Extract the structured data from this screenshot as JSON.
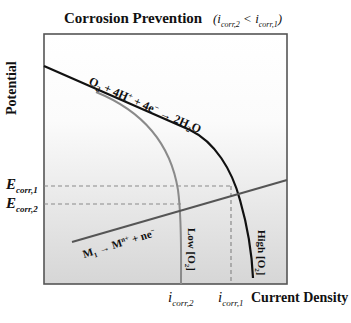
{
  "figure": {
    "title": "Corrosion Prevention",
    "subtitle_left": "(i",
    "subtitle": "(i_corr,2 < i_corr,1)",
    "subtitle_parts": {
      "open": "(",
      "i1": "i",
      "s1": "corr,2",
      "lt": " < ",
      "i2": "i",
      "s2": "corr,1",
      "close": ")"
    },
    "y_axis_label": "Potential",
    "x_axis_label": "Current Density",
    "e_labels": [
      {
        "main": "E",
        "sub": "corr,1"
      },
      {
        "main": "E",
        "sub": "corr,2"
      }
    ],
    "i_labels": [
      {
        "main": "i",
        "sub": "corr,2"
      },
      {
        "main": "i",
        "sub": "corr,1"
      }
    ],
    "cathodic_reaction": "O2 + 4H+ + 4e- → 2H2O",
    "anodic_reaction": "M1 → Mn+ + ne-",
    "curve_labels": {
      "low": "Low [O2]",
      "high": "High [O2]"
    },
    "colors": {
      "high_curve": "#111111",
      "low_curve": "#8a8a8a",
      "anodic_line": "#555555",
      "dashed": "#8a8a8a",
      "frame": "#555555",
      "gradient_bottom": "#d6d6d6"
    }
  }
}
